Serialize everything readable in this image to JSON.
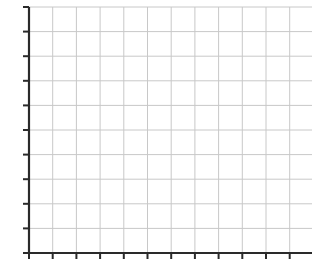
{
  "chart_data": {
    "type": "line",
    "title": "",
    "xlabel": "",
    "ylabel": "",
    "series": [],
    "grid": true,
    "x_ticks": 12,
    "y_ticks": 11,
    "x_tick_labels": [],
    "y_tick_labels": [],
    "legend": null,
    "note": "Empty grid with axes; tick labels not legible/visible"
  },
  "layout": {
    "origin_x": 29,
    "origin_y": 253,
    "top_y": 7,
    "x_step": 23.7,
    "y_step": 24.6,
    "x_lines": 12,
    "y_lines": 10,
    "grid_color": "#c8c8c8",
    "axis_color": "#2a2a2a"
  }
}
